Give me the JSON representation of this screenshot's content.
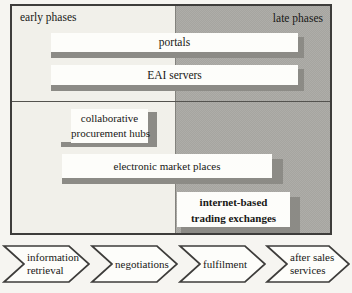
{
  "figure": {
    "header": {
      "early_label": "early phases",
      "late_label": "late phases"
    },
    "rows": [
      {
        "id": "portals",
        "label": "portals",
        "lines": [
          "portals"
        ]
      },
      {
        "id": "eai-servers",
        "label": "EAI servers",
        "lines": [
          "EAI servers"
        ]
      },
      {
        "id": "collaborative-procurement-hubs",
        "label": "collaborative procurement hubs",
        "lines": [
          "collaborative",
          "procurement hubs"
        ]
      },
      {
        "id": "electronic-market-places",
        "label": "electronic market places",
        "lines": [
          "electronic market places"
        ]
      },
      {
        "id": "internet-based-trading-exchanges",
        "label": "internet-based trading exchanges",
        "lines": [
          "internet-based",
          "trading exchanges"
        ],
        "bold": true
      }
    ],
    "process_arrows": [
      {
        "id": "information-retrieval",
        "label": "information retrieval",
        "lines": [
          "information",
          "retrieval"
        ]
      },
      {
        "id": "negotiations",
        "label": "negotiations",
        "lines": [
          "negotiations"
        ]
      },
      {
        "id": "fulfilment",
        "label": "fulfilment",
        "lines": [
          "fulfilment"
        ]
      },
      {
        "id": "after-sales-services",
        "label": "after sales services",
        "lines": [
          "after sales",
          "services"
        ]
      }
    ],
    "colors": {
      "light_region": "#f1f0ea",
      "dark_region": "#a6a5a0",
      "timeline_bar": "#8c8b86",
      "label_box_fill": "#fdfdfa",
      "frame_border": "#3e3d3b",
      "text": "#181816"
    }
  }
}
